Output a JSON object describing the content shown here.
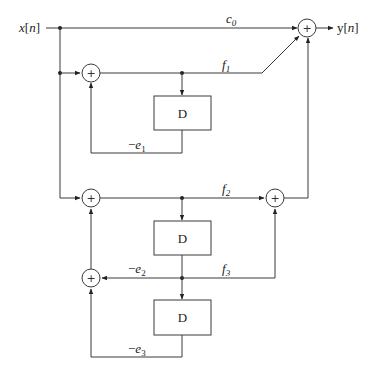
{
  "diagram": {
    "type": "lattice-ladder filter block diagram",
    "input": {
      "label": "x[n]"
    },
    "output": {
      "label": "y[n]"
    },
    "adder_symbol": "+",
    "delay_label": "D",
    "coefficients": {
      "c0": {
        "base": "c",
        "sub": "0"
      },
      "f1": {
        "base": "f",
        "sub": "1"
      },
      "f2": {
        "base": "f",
        "sub": "2"
      },
      "f3": {
        "base": "f",
        "sub": "3"
      },
      "e1": {
        "prefix": "−",
        "base": "e",
        "sub": "1"
      },
      "e2": {
        "prefix": "−",
        "base": "e",
        "sub": "2"
      },
      "e3": {
        "prefix": "−",
        "base": "e",
        "sub": "3"
      }
    },
    "blocks": [
      {
        "id": "sum-out",
        "kind": "adder"
      },
      {
        "id": "sum-1",
        "kind": "adder"
      },
      {
        "id": "sum-2",
        "kind": "adder"
      },
      {
        "id": "sum-3",
        "kind": "adder"
      },
      {
        "id": "sum-4",
        "kind": "adder"
      },
      {
        "id": "delay-1",
        "kind": "delay"
      },
      {
        "id": "delay-2",
        "kind": "delay"
      },
      {
        "id": "delay-3",
        "kind": "delay"
      }
    ]
  }
}
